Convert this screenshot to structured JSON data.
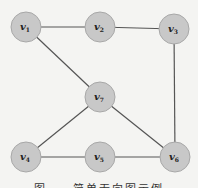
{
  "diagram": {
    "type": "undirected-graph",
    "node_fill": "#c8c8c8",
    "node_stroke": "#a8a8a8",
    "edge_color": "#555555",
    "node_radius": 15,
    "nodes": [
      {
        "id": "v1",
        "label": "v",
        "sub": "1",
        "x": 26,
        "y": 27
      },
      {
        "id": "v2",
        "label": "v",
        "sub": "2",
        "x": 100,
        "y": 27
      },
      {
        "id": "v3",
        "label": "v",
        "sub": "3",
        "x": 174,
        "y": 29
      },
      {
        "id": "v7",
        "label": "v",
        "sub": "7",
        "x": 100,
        "y": 97
      },
      {
        "id": "v4",
        "label": "v",
        "sub": "4",
        "x": 26,
        "y": 157
      },
      {
        "id": "v5",
        "label": "v",
        "sub": "5",
        "x": 100,
        "y": 157
      },
      {
        "id": "v6",
        "label": "v",
        "sub": "6",
        "x": 175,
        "y": 157
      }
    ],
    "edges": [
      [
        "v1",
        "v2"
      ],
      [
        "v2",
        "v3"
      ],
      [
        "v1",
        "v7"
      ],
      [
        "v3",
        "v6"
      ],
      [
        "v7",
        "v4"
      ],
      [
        "v7",
        "v6"
      ],
      [
        "v4",
        "v5"
      ],
      [
        "v5",
        "v6"
      ]
    ]
  },
  "caption": "图　　简单无向图示例"
}
